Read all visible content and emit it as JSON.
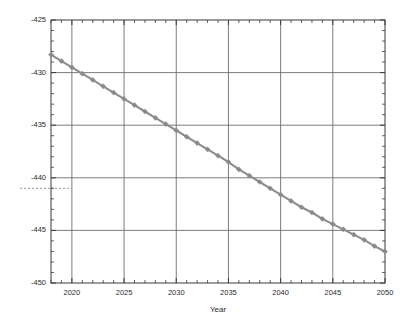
{
  "chart_data": {
    "type": "line",
    "title": "",
    "subtitle": "",
    "xlabel": "Year",
    "ylabel": "",
    "xlim": [
      2018,
      2050
    ],
    "ylim": [
      -450,
      -425
    ],
    "grid": true,
    "legend": "none",
    "x_ticks": [
      2020,
      2025,
      2030,
      2035,
      2040,
      2045,
      2050
    ],
    "x_tick_labels": [
      "2020",
      "2025",
      "2030",
      "2035",
      "2040",
      "2045",
      "2050"
    ],
    "x_minor_tick_step": 1,
    "y_ticks": [
      -450,
      -445,
      -440,
      -435,
      -430,
      -425
    ],
    "y_tick_labels": [
      "-450",
      "-445",
      "-440",
      "-435",
      "-430",
      "-425"
    ],
    "y_minor_tick_step": 1,
    "series": [
      {
        "name": "projection",
        "color": "#8a8a8a",
        "marker": "diamond",
        "x": [
          2018,
          2019,
          2020,
          2021,
          2022,
          2023,
          2024,
          2025,
          2026,
          2027,
          2028,
          2029,
          2030,
          2031,
          2032,
          2033,
          2034,
          2035,
          2036,
          2037,
          2038,
          2039,
          2040,
          2041,
          2042,
          2043,
          2044,
          2045,
          2046,
          2047,
          2048,
          2049,
          2050
        ],
        "values": [
          -428.3,
          -428.9,
          -429.5,
          -430.1,
          -430.7,
          -431.3,
          -431.9,
          -432.5,
          -433.1,
          -433.7,
          -434.3,
          -434.9,
          -435.5,
          -436.1,
          -436.7,
          -437.3,
          -437.9,
          -438.5,
          -439.2,
          -439.8,
          -440.4,
          -441.0,
          -441.6,
          -442.2,
          -442.8,
          -443.3,
          -443.9,
          -444.4,
          -444.9,
          -445.4,
          -445.9,
          -446.5,
          -447.0
        ]
      }
    ],
    "annotations": [
      {
        "type": "reference-line",
        "orientation": "horizontal",
        "style": "dashed",
        "color": "#9a9a9a",
        "value": -441.0,
        "label": ""
      }
    ]
  }
}
